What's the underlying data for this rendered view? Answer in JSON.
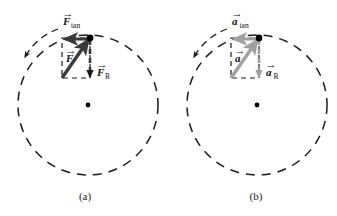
{
  "figure": {
    "width": 337,
    "height": 216,
    "background": "#ffffff"
  },
  "colors": {
    "dark_vector": "#3a3a3a",
    "gray_vector": "#a0a0a0",
    "dashed_line": "#1a1a1a",
    "particle_dot": "#000000",
    "center_dot": "#000000",
    "text": "#111111"
  },
  "panels": [
    {
      "id": "panel-a",
      "caption": "(a)",
      "caption_x": 85,
      "caption_y": 200,
      "circle": {
        "cx": 88,
        "cy": 105,
        "r": 70
      },
      "center_dot": {
        "cx": 88,
        "cy": 105,
        "r": 2.4
      },
      "particle_dot": {
        "cx": 90,
        "cy": 38,
        "r": 3.4
      },
      "vector_color": "#3a3a3a",
      "motion_arc": {
        "label": "counterclockwise-motion-arc",
        "path": "M 58 29 A 62 62 0 0 0 25 57",
        "arrow_tip": {
          "x": 23,
          "y": 61
        }
      },
      "rect": {
        "x": 62,
        "y": 38,
        "w": 28,
        "h": 40
      },
      "vectors": [
        {
          "name": "resultant",
          "label": "F",
          "subscript": "",
          "style": "solid",
          "from": {
            "x": 62,
            "y": 78
          },
          "to": {
            "x": 89,
            "y": 39
          },
          "label_x": 66,
          "label_y": 62
        },
        {
          "name": "tangential",
          "label": "F",
          "subscript": "tan",
          "style": "solid",
          "from": {
            "x": 89,
            "y": 39
          },
          "to": {
            "x": 63,
            "y": 39
          },
          "label_x": 63,
          "label_y": 24
        },
        {
          "name": "radial",
          "label": "F",
          "subscript": "R",
          "style": "dashed",
          "from": {
            "x": 90,
            "y": 40
          },
          "to": {
            "x": 90,
            "y": 76
          },
          "label_x": 97,
          "label_y": 76
        }
      ]
    },
    {
      "id": "panel-b",
      "caption": "(b)",
      "caption_x": 256,
      "caption_y": 200,
      "circle": {
        "cx": 257,
        "cy": 105,
        "r": 70
      },
      "center_dot": {
        "cx": 257,
        "cy": 105,
        "r": 2.4
      },
      "particle_dot": {
        "cx": 259,
        "cy": 38,
        "r": 3.4
      },
      "vector_color": "#a0a0a0",
      "motion_arc": {
        "label": "counterclockwise-motion-arc",
        "path": "M 227 29 A 62 62 0 0 0 194 57",
        "arrow_tip": {
          "x": 192,
          "y": 61
        }
      },
      "rect": {
        "x": 231,
        "y": 38,
        "w": 28,
        "h": 40
      },
      "vectors": [
        {
          "name": "resultant",
          "label": "a",
          "subscript": "",
          "style": "solid",
          "from": {
            "x": 231,
            "y": 78
          },
          "to": {
            "x": 258,
            "y": 39
          },
          "label_x": 235,
          "label_y": 62
        },
        {
          "name": "tangential",
          "label": "a",
          "subscript": "tan",
          "style": "solid",
          "from": {
            "x": 258,
            "y": 39
          },
          "to": {
            "x": 232,
            "y": 39
          },
          "label_x": 232,
          "label_y": 24
        },
        {
          "name": "radial",
          "label": "a",
          "subscript": "R",
          "style": "dashed",
          "from": {
            "x": 259,
            "y": 40
          },
          "to": {
            "x": 259,
            "y": 76
          },
          "label_x": 266,
          "label_y": 76
        }
      ]
    }
  ],
  "labels": {
    "a_resultant": "F",
    "a_tangential": "F",
    "a_tangential_sub": "tan",
    "a_radial": "F",
    "a_radial_sub": "R",
    "b_resultant": "a",
    "b_tangential": "a",
    "b_tangential_sub": "tan",
    "b_radial": "a",
    "b_radial_sub": "R",
    "caption_a": "(a)",
    "caption_b": "(b)"
  }
}
